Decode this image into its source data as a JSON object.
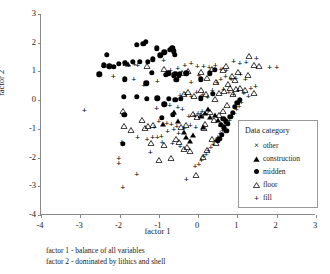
{
  "chart_data": {
    "type": "scatter",
    "title": "",
    "xlabel": "factor 1",
    "ylabel": "factor 2",
    "xlim": [
      -4,
      3
    ],
    "ylim": [
      -4,
      3
    ],
    "xticks": [
      "-4",
      "-3",
      "-2",
      "-1",
      "0",
      "1",
      "2",
      "3"
    ],
    "yticks": [
      "3",
      "2",
      "1",
      "0",
      "-1",
      "-2",
      "-3",
      "-4"
    ],
    "xtick_values": [
      -4,
      -3,
      -2,
      -1,
      0,
      1,
      2,
      3
    ],
    "ytick_values": [
      3,
      2,
      1,
      0,
      -1,
      -2,
      -3,
      -4
    ],
    "grid": false,
    "legend_position": "inside-bottom-right",
    "legend_title": "Data category",
    "series": [
      {
        "name": "other",
        "marker": "x",
        "points": []
      },
      {
        "name": "construction",
        "marker": "triangle-filled",
        "points": [
          [
            -1.78,
            1.26
          ],
          [
            -0.52,
            -0.72
          ],
          [
            -0.36,
            -1.12
          ],
          [
            -0.3,
            -1.3
          ],
          [
            -0.22,
            -1.44
          ],
          [
            -0.12,
            -1.22
          ],
          [
            0.08,
            -0.56
          ],
          [
            0.18,
            -0.44
          ],
          [
            0.3,
            -0.6
          ],
          [
            0.42,
            -0.5
          ],
          [
            0.5,
            -0.7
          ],
          [
            0.58,
            -0.82
          ],
          [
            -0.62,
            -0.4
          ],
          [
            -0.9,
            -0.82
          ],
          [
            0.12,
            -0.92
          ],
          [
            0.26,
            -0.3
          ]
        ]
      },
      {
        "name": "midden",
        "marker": "circle-filled",
        "points": [
          [
            -2.52,
            0.9
          ],
          [
            -2.4,
            1.22
          ],
          [
            -2.32,
            1.58
          ],
          [
            -2.26,
            1.18
          ],
          [
            -2.14,
            1.16
          ],
          [
            -2.02,
            1.26
          ],
          [
            -1.86,
            1.3
          ],
          [
            -1.66,
            1.34
          ],
          [
            -1.56,
            1.92
          ],
          [
            -1.48,
            1.34
          ],
          [
            -1.4,
            1.96
          ],
          [
            -1.34,
            2.04
          ],
          [
            -1.28,
            1.34
          ],
          [
            -1.16,
            1.42
          ],
          [
            -1.06,
            1.8
          ],
          [
            -0.96,
            1.56
          ],
          [
            -0.86,
            1.66
          ],
          [
            -0.72,
            1.76
          ],
          [
            -0.66,
            1.8
          ],
          [
            -0.62,
            1.7
          ],
          [
            -0.6,
            1.58
          ],
          [
            -1.86,
            0.72
          ],
          [
            -1.32,
            0.58
          ],
          [
            -1.18,
            0.96
          ],
          [
            -0.82,
            0.88
          ],
          [
            -0.76,
            0.94
          ],
          [
            -0.62,
            0.86
          ],
          [
            -0.56,
            0.7
          ],
          [
            -0.46,
            0.92
          ],
          [
            -0.3,
            0.94
          ],
          [
            0.06,
            0.72
          ],
          [
            0.3,
            0.94
          ],
          [
            0.42,
            1.06
          ],
          [
            -1.9,
            0.12
          ],
          [
            -1.56,
            0.12
          ],
          [
            -1.3,
            0.04
          ],
          [
            -1.04,
            0.06
          ],
          [
            -0.86,
            -0.14
          ],
          [
            -0.74,
            0.04
          ],
          [
            -0.58,
            0.02
          ],
          [
            -0.44,
            0.04
          ],
          [
            0.06,
            0.06
          ],
          [
            0.38,
            0.22
          ],
          [
            -1.88,
            -0.5
          ],
          [
            -0.92,
            -0.62
          ],
          [
            -0.64,
            -0.52
          ],
          [
            -1.92,
            -1.52
          ],
          [
            0.64,
            -0.66
          ],
          [
            0.7,
            -0.74
          ],
          [
            0.76,
            -0.82
          ],
          [
            0.82,
            -0.58
          ],
          [
            0.88,
            -0.44
          ],
          [
            0.94,
            -0.24
          ],
          [
            1.0,
            -0.1
          ],
          [
            1.06,
            0.02
          ],
          [
            0.58,
            -0.86
          ],
          [
            0.66,
            -0.94
          ],
          [
            0.72,
            -1.06
          ],
          [
            0.6,
            -1.2
          ],
          [
            0.54,
            -1.34
          ],
          [
            0.5,
            -1.42
          ],
          [
            -0.58,
            0.92
          ],
          [
            -0.5,
            0.84
          ]
        ]
      },
      {
        "name": "floor",
        "marker": "triangle-open",
        "points": [
          [
            -1.84,
            1.54
          ],
          [
            -1.3,
            1.42
          ],
          [
            -0.86,
            1.32
          ],
          [
            -0.4,
            1.2
          ],
          [
            -0.26,
            1.26
          ],
          [
            0.06,
            1.24
          ],
          [
            0.34,
            1.34
          ],
          [
            0.62,
            1.3
          ],
          [
            0.7,
            1.44
          ],
          [
            0.86,
            1.08
          ],
          [
            1.02,
            1.24
          ],
          [
            1.3,
            1.78
          ],
          [
            1.42,
            1.46
          ],
          [
            1.54,
            1.42
          ],
          [
            1.28,
            1.12
          ],
          [
            -1.92,
            -0.14
          ],
          [
            -1.9,
            -0.66
          ],
          [
            -1.7,
            -0.78
          ],
          [
            -1.44,
            -0.44
          ],
          [
            -1.36,
            -0.72
          ],
          [
            -1.28,
            -0.66
          ],
          [
            -1.14,
            -0.62
          ],
          [
            -1.2,
            -1.26
          ],
          [
            -0.86,
            -1.32
          ],
          [
            -0.68,
            -1.78
          ],
          [
            -1.0,
            -1.84
          ],
          [
            -0.56,
            -1.12
          ],
          [
            -0.48,
            -1.2
          ],
          [
            -0.36,
            -1.46
          ],
          [
            -0.28,
            -1.4
          ],
          [
            -0.2,
            -1.52
          ],
          [
            -0.06,
            -2.38
          ],
          [
            0.14,
            -0.74
          ],
          [
            0.3,
            -0.18
          ],
          [
            0.4,
            -0.46
          ],
          [
            0.52,
            -0.26
          ],
          [
            0.62,
            -0.12
          ],
          [
            0.74,
            0.06
          ],
          [
            0.88,
            0.46
          ],
          [
            0.96,
            0.62
          ],
          [
            0.8,
            0.66
          ],
          [
            0.66,
            0.56
          ],
          [
            0.54,
            0.48
          ],
          [
            0.42,
            0.3
          ],
          [
            0.2,
            0.46
          ],
          [
            0.08,
            0.58
          ],
          [
            -0.1,
            0.4
          ],
          [
            -0.26,
            0.52
          ],
          [
            -0.36,
            0.46
          ],
          [
            0.22,
            1.0
          ],
          [
            0.46,
            0.86
          ],
          [
            0.76,
            0.8
          ],
          [
            0.94,
            0.94
          ],
          [
            1.06,
            0.68
          ],
          [
            1.2,
            0.58
          ],
          [
            1.42,
            0.48
          ],
          [
            -0.14,
            -0.24
          ],
          [
            -0.02,
            -0.34
          ],
          [
            0.08,
            -0.28
          ],
          [
            0.18,
            -0.58
          ],
          [
            -0.44,
            -0.7
          ],
          [
            -0.3,
            -0.62
          ],
          [
            0.34,
            -1.1
          ],
          [
            0.46,
            -1.26
          ],
          [
            0.22,
            -1.48
          ],
          [
            0.12,
            -1.72
          ]
        ]
      },
      {
        "name": "fill",
        "marker": "plus",
        "points": [
          [
            -2.9,
            -0.34
          ],
          [
            -2.16,
            0.84
          ],
          [
            -2.42,
            1.18
          ],
          [
            -1.78,
            1.24
          ],
          [
            -1.62,
            1.26
          ],
          [
            -1.54,
            1.24
          ],
          [
            -1.88,
            0.7
          ],
          [
            -1.64,
            0.72
          ],
          [
            -2.02,
            -2.02
          ],
          [
            -2.02,
            -2.18
          ],
          [
            -1.94,
            -1.46
          ],
          [
            -1.54,
            -1.3
          ],
          [
            -1.3,
            -1.34
          ],
          [
            -1.16,
            -1.3
          ],
          [
            -1.04,
            -1.28
          ],
          [
            -0.94,
            -1.26
          ],
          [
            -1.12,
            -0.92
          ],
          [
            -0.78,
            -1.08
          ],
          [
            -0.62,
            -1.02
          ],
          [
            -0.5,
            -1.14
          ],
          [
            -1.56,
            -2.56
          ],
          [
            -1.92,
            -3.02
          ],
          [
            -0.3,
            -2.74
          ],
          [
            -0.08,
            -2.3
          ],
          [
            0.02,
            -2.24
          ],
          [
            0.08,
            -2.08
          ],
          [
            0.14,
            -1.96
          ],
          [
            0.2,
            -1.86
          ],
          [
            0.26,
            -1.74
          ],
          [
            0.32,
            -1.62
          ],
          [
            0.38,
            -1.52
          ],
          [
            0.44,
            -1.4
          ],
          [
            0.5,
            -1.28
          ],
          [
            0.56,
            -1.16
          ],
          [
            0.62,
            -1.04
          ],
          [
            0.68,
            -0.92
          ],
          [
            0.74,
            -0.8
          ],
          [
            0.8,
            -0.68
          ],
          [
            0.86,
            -0.56
          ],
          [
            0.92,
            -0.44
          ],
          [
            0.98,
            -0.32
          ],
          [
            1.04,
            -0.2
          ],
          [
            1.1,
            -0.08
          ],
          [
            -0.06,
            -0.94
          ],
          [
            -0.2,
            -0.86
          ],
          [
            -0.36,
            -0.96
          ],
          [
            -0.54,
            -0.9
          ],
          [
            -0.68,
            -0.84
          ],
          [
            -0.8,
            -0.78
          ],
          [
            -1.0,
            -0.74
          ],
          [
            -0.24,
            -0.56
          ],
          [
            -0.1,
            -0.52
          ],
          [
            0.0,
            -0.44
          ],
          [
            0.1,
            -0.38
          ],
          [
            -0.4,
            -0.3
          ],
          [
            -0.52,
            -0.24
          ],
          [
            -0.72,
            -0.18
          ],
          [
            -0.88,
            -0.12
          ],
          [
            -1.06,
            -0.28
          ],
          [
            -0.46,
            0.18
          ],
          [
            -0.32,
            0.22
          ],
          [
            -0.18,
            0.16
          ],
          [
            -0.04,
            0.28
          ],
          [
            0.12,
            0.2
          ],
          [
            0.24,
            0.12
          ],
          [
            0.36,
            0.34
          ],
          [
            0.48,
            0.62
          ],
          [
            0.58,
            0.74
          ],
          [
            0.7,
            0.84
          ],
          [
            0.84,
            0.72
          ],
          [
            0.96,
            0.78
          ],
          [
            1.08,
            0.9
          ],
          [
            1.2,
            0.74
          ],
          [
            -0.7,
            1.06
          ],
          [
            -0.52,
            1.12
          ],
          [
            -0.34,
            1.22
          ],
          [
            -0.18,
            1.3
          ],
          [
            -0.02,
            1.18
          ],
          [
            0.14,
            1.2
          ],
          [
            0.28,
            1.16
          ],
          [
            0.44,
            1.22
          ],
          [
            0.58,
            1.1
          ],
          [
            0.72,
            1.04
          ],
          [
            0.9,
            1.36
          ],
          [
            1.06,
            1.28
          ],
          [
            1.22,
            1.32
          ],
          [
            1.48,
            1.46
          ],
          [
            1.82,
            1.16
          ],
          [
            2.0,
            1.16
          ],
          [
            -1.38,
            0.52
          ],
          [
            -1.22,
            -1.82
          ],
          [
            -0.88,
            1.4
          ],
          [
            0.64,
            0.4
          ],
          [
            0.78,
            0.3
          ],
          [
            0.9,
            0.2
          ],
          [
            1.02,
            0.36
          ],
          [
            1.16,
            0.26
          ],
          [
            1.28,
            0.14
          ],
          [
            1.34,
            0.44
          ],
          [
            1.46,
            0.48
          ],
          [
            -1.04,
            0.66
          ],
          [
            -0.18,
            0.64
          ],
          [
            0.02,
            0.86
          ],
          [
            -0.66,
            -1.5
          ],
          [
            -0.92,
            -1.46
          ],
          [
            -0.46,
            -1.58
          ]
        ]
      }
    ]
  },
  "legend": {
    "title": "Data category",
    "entries": [
      {
        "label": "other",
        "symbol": "x"
      },
      {
        "label": "construction",
        "symbol": "triangle-filled"
      },
      {
        "label": "midden",
        "symbol": "circle-filled"
      },
      {
        "label": "floor",
        "symbol": "triangle-open"
      },
      {
        "label": "fill",
        "symbol": "plus"
      }
    ]
  },
  "captions": [
    "factor 1 - balance of all variables",
    "factor 2 - dominated by lithics and shell"
  ]
}
